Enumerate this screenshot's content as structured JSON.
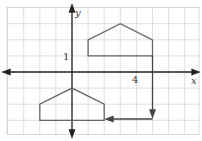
{
  "diagram": {
    "type": "coordinate-grid-transformation",
    "axes": {
      "x_label": "x",
      "y_label": "y",
      "tick_labels": [
        {
          "axis": "x",
          "value": 4,
          "text": "4"
        },
        {
          "axis": "y",
          "value": 1,
          "text": "1"
        }
      ],
      "x_range": [
        -4,
        7.8
      ],
      "y_range": [
        -3.8,
        4
      ]
    },
    "grid": {
      "on": true,
      "unit_px": 16.1,
      "origin_px": [
        72,
        72
      ]
    },
    "shapes": [
      {
        "name": "original-pentagon",
        "points": [
          [
            1,
            1
          ],
          [
            1,
            2
          ],
          [
            3,
            3
          ],
          [
            5,
            2
          ],
          [
            5,
            1
          ]
        ]
      },
      {
        "name": "image-pentagon",
        "points": [
          [
            -2,
            -3
          ],
          [
            -2,
            -2
          ],
          [
            0,
            -1
          ],
          [
            2,
            -2
          ],
          [
            2,
            -3
          ]
        ]
      }
    ],
    "arrows": [
      {
        "name": "translate-down-arrow",
        "from": [
          5,
          1
        ],
        "to": [
          5,
          -3
        ]
      },
      {
        "name": "translate-left-arrow",
        "from": [
          5,
          -3
        ],
        "to": [
          2.1,
          -3
        ]
      }
    ],
    "colors": {
      "grid": "#d8d8d8",
      "axis": "#222222",
      "shape": "#666666"
    }
  }
}
